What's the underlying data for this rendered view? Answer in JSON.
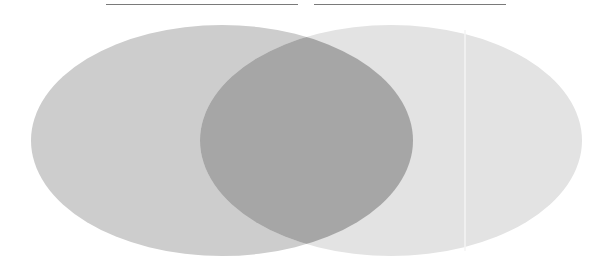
{
  "diagram": {
    "type": "venn",
    "sets": [
      {
        "name": "left-set",
        "label": "",
        "color": "#cdcdcd"
      },
      {
        "name": "right-set",
        "label": "",
        "color": "#e3e3e3"
      }
    ],
    "intersection": {
      "label": "",
      "color": "#a6a6a6"
    },
    "header_lines": [
      {
        "name": "left-title-underline",
        "color": "#7a7a7a"
      },
      {
        "name": "right-title-underline",
        "color": "#7a7a7a"
      }
    ],
    "background": "#ffffff"
  }
}
